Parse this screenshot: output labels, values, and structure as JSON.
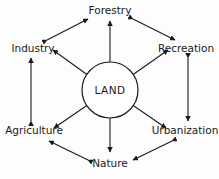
{
  "diagram": {
    "center": {
      "id": "land",
      "label": "LAND",
      "shape": "circle"
    },
    "colors": {
      "stroke": "#1a1a1a",
      "text": "#1a1a1a",
      "background": "#fdfdfd",
      "node_fill": "#ffffff"
    },
    "nodes": [
      {
        "id": "forestry",
        "label": "Forestry",
        "position": "top"
      },
      {
        "id": "recreation",
        "label": "Recreation",
        "position": "top-right"
      },
      {
        "id": "urbanization",
        "label": "Urbanization",
        "position": "bottom-right"
      },
      {
        "id": "nature",
        "label": "Nature",
        "position": "bottom"
      },
      {
        "id": "agriculture",
        "label": "Agriculture",
        "position": "bottom-left"
      },
      {
        "id": "industry",
        "label": "Industry",
        "position": "top-left"
      }
    ],
    "spokes": [
      {
        "from": "land",
        "to": "forestry",
        "arrows": "both"
      },
      {
        "from": "land",
        "to": "recreation",
        "arrows": "both"
      },
      {
        "from": "land",
        "to": "urbanization",
        "arrows": "both"
      },
      {
        "from": "land",
        "to": "nature",
        "arrows": "both"
      },
      {
        "from": "land",
        "to": "agriculture",
        "arrows": "both"
      },
      {
        "from": "land",
        "to": "industry",
        "arrows": "both"
      }
    ],
    "ring_links": [
      {
        "from": "industry",
        "to": "forestry",
        "arrows": "both"
      },
      {
        "from": "forestry",
        "to": "recreation",
        "arrows": "both"
      },
      {
        "from": "recreation",
        "to": "urbanization",
        "arrows": "both"
      },
      {
        "from": "urbanization",
        "to": "nature",
        "arrows": "both"
      },
      {
        "from": "nature",
        "to": "agriculture",
        "arrows": "both"
      },
      {
        "from": "agriculture",
        "to": "industry",
        "arrows": "both"
      }
    ]
  }
}
